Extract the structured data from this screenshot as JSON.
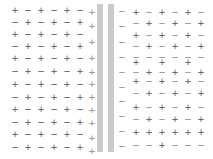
{
  "colors": {
    "charge": "#555555",
    "charge_faint": "#8a8a8a",
    "plate": "#cacaca",
    "background": "#ffffff"
  },
  "plates": [
    {
      "name": "left-plate",
      "x": 97,
      "y": 4,
      "w": 6,
      "h": 148
    },
    {
      "name": "right-plate",
      "x": 108,
      "y": 4,
      "w": 6,
      "h": 148
    }
  ],
  "left_grid": {
    "cols_x": [
      15,
      28,
      41,
      54,
      67,
      80
    ],
    "rows_y": [
      10,
      22,
      34,
      46,
      58,
      71,
      84,
      97,
      109,
      122,
      134,
      147
    ],
    "odd_row_start": "+",
    "even_row_start": "−"
  },
  "left_plate_charges": {
    "symbol": "+",
    "x": 92,
    "ys": [
      12,
      26,
      42,
      58,
      72,
      84,
      97,
      110,
      123,
      138,
      151
    ]
  },
  "right_plate_charges": {
    "symbol": "−",
    "x": 122,
    "ys": [
      11,
      26,
      42,
      57,
      72,
      87,
      101,
      116,
      131,
      146
    ]
  },
  "right_grid": {
    "cols_x": [
      136,
      149,
      162,
      175,
      188,
      201
    ],
    "rows": [
      {
        "y": 12,
        "symbols": [
          "+",
          "−",
          "+",
          "−",
          "+",
          "−"
        ]
      },
      {
        "y": 23,
        "symbols": [
          "−",
          "+",
          "−",
          "+",
          "−",
          "+"
        ]
      },
      {
        "y": 35,
        "symbols": [
          "+",
          "−",
          "+",
          "−",
          "+",
          "−"
        ]
      },
      {
        "y": 46,
        "symbols": [
          "−",
          "+",
          "−",
          "+",
          "−",
          "+"
        ]
      },
      {
        "y": 57,
        "symbols": [
          "−",
          "−",
          "−",
          "−",
          "−",
          "−"
        ]
      },
      {
        "y": 62,
        "symbols": [
          "+",
          "",
          "+",
          "",
          "+",
          ""
        ]
      },
      {
        "y": 72,
        "symbols": [
          "−",
          "+",
          "−",
          "+",
          "−",
          "+"
        ]
      },
      {
        "y": 81,
        "symbols": [
          "+",
          "−",
          "+",
          "−",
          "+",
          "−"
        ]
      },
      {
        "y": 93,
        "symbols": [
          "−",
          "+",
          "−",
          "+",
          "−",
          "+"
        ]
      },
      {
        "y": 107,
        "symbols": [
          "+",
          "−",
          "+",
          "−",
          "+",
          "−"
        ]
      },
      {
        "y": 119,
        "symbols": [
          "−",
          "+",
          "−",
          "+",
          "−",
          "+"
        ]
      },
      {
        "y": 132,
        "symbols": [
          "+",
          "+",
          "+",
          "+",
          "+",
          "+"
        ]
      },
      {
        "y": 145,
        "symbols": [
          "−",
          "−",
          "+",
          "−",
          "−",
          "−"
        ]
      }
    ]
  }
}
